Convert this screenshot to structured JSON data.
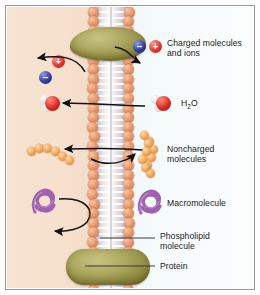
{
  "figure": {
    "regions": {
      "cytoplasm_color": "#f6e0cd",
      "extracellular_color": "#f2f9fa",
      "frame_color": "#9a9a9a"
    }
  },
  "legend": {
    "items": [
      {
        "id": "charged",
        "label": "Charged molecules\nand ions",
        "icon": "ion-pair-icon",
        "ions": [
          {
            "sign": "–",
            "color": "#333c9e",
            "name": "negative-ion"
          },
          {
            "sign": "+",
            "color": "#e8352f",
            "name": "positive-ion"
          }
        ],
        "permeable": false
      },
      {
        "id": "water",
        "label": "H₂O",
        "label_parts": {
          "pre": "H",
          "sub": "2",
          "post": "O"
        },
        "icon": "water-molecule-icon",
        "colors": {
          "oxygen": "#dd2b22",
          "hydrogen": "#ffffff"
        },
        "permeable": true
      },
      {
        "id": "noncharged",
        "label": "Noncharged\nmolecules",
        "icon": "bead-chain-icon",
        "color": "#f1a255",
        "permeable": true
      },
      {
        "id": "macromolecule",
        "label": "Macromolecule",
        "icon": "coiled-macromolecule-icon",
        "color": "#a濃",
        "color_hex": "#a56bb0",
        "permeable": false
      },
      {
        "id": "phospholipid",
        "label": "Phospholipid\nmolecule",
        "icon": "leader-line-icon",
        "color": "#e79a6e"
      },
      {
        "id": "protein",
        "label": "Protein",
        "icon": "leader-line-icon",
        "color": "#a9a45c"
      }
    ]
  },
  "structures": {
    "membrane": {
      "name": "phospholipid-bilayer",
      "head_color": "#e79a6e",
      "tail_color": "#ffffff"
    },
    "protein_top": {
      "name": "membrane-protein-top",
      "color": "#a9a45c"
    },
    "protein_bottom": {
      "name": "membrane-protein-bottom",
      "color": "#a9a45c"
    }
  },
  "arrows": [
    {
      "name": "charged-blocked-arrow",
      "from": "membrane",
      "to": "extracellular",
      "meaning": "charged molecules cannot cross"
    },
    {
      "name": "charged-blocked-arrow-left",
      "from": "membrane",
      "to": "cytoplasm",
      "meaning": "charged molecules cannot cross"
    },
    {
      "name": "water-crossing-arrow",
      "from": "membrane",
      "to": "cytoplasm",
      "meaning": "water crosses freely"
    },
    {
      "name": "noncharged-crossing-arrow-left",
      "from": "membrane",
      "to": "cytoplasm",
      "meaning": "noncharged molecules cross"
    },
    {
      "name": "noncharged-crossing-arrow-right",
      "from": "membrane",
      "to": "extracellular",
      "meaning": "noncharged molecules cross"
    },
    {
      "name": "macromolecule-blocked-arrow",
      "from": "macromolecule",
      "to": "cytoplasm",
      "meaning": "macromolecules cannot cross"
    }
  ]
}
